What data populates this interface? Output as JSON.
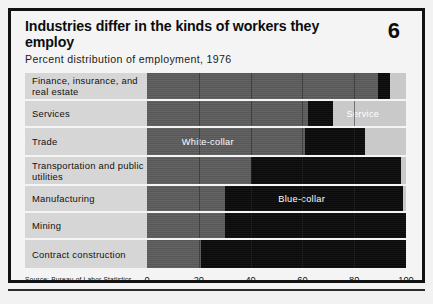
{
  "figure": {
    "title": "Industries differ in the kinds of workers they employ",
    "number": "6",
    "subtitle": "Percent distribution of employment, 1976",
    "source": "Source: Bureau of Labor Statistics"
  },
  "labels": {
    "white_collar": "White-collar",
    "blue_collar": "Blue-collar",
    "service": "Service"
  },
  "colors": {
    "white_collar": "#5c5c5c",
    "blue_collar": "#0b0b0b",
    "service": "#c9c9c9",
    "label_panel": "#d6d6d6",
    "frame": "#111111"
  },
  "chart_data": {
    "type": "bar",
    "orientation": "horizontal",
    "stacked": true,
    "title": "Industries differ in the kinds of workers they employ",
    "subtitle": "Percent distribution of employment, 1976",
    "xlabel": "",
    "ylabel": "",
    "xlim": [
      0,
      100
    ],
    "xticks": [
      0,
      20,
      40,
      60,
      80,
      100
    ],
    "xticklabels": [
      "0",
      "20",
      "40",
      "60",
      "80",
      "100"
    ],
    "grid": true,
    "legend": [
      "White-collar",
      "Blue-collar",
      "Service"
    ],
    "legend_position": "in-bars",
    "categories": [
      "Finance, insurance, and real estate",
      "Services",
      "Trade",
      "Transportation and public utilities",
      "Manufacturing",
      "Mining",
      "Contract construction"
    ],
    "series": [
      {
        "name": "White-collar",
        "values": [
          89,
          62,
          61,
          40,
          30,
          30,
          21
        ]
      },
      {
        "name": "Blue-collar",
        "values": [
          5,
          10,
          23,
          58,
          69,
          70,
          79
        ]
      },
      {
        "name": "Service",
        "values": [
          6,
          28,
          16,
          2,
          1,
          0,
          0
        ]
      }
    ]
  },
  "rows": [
    {
      "label": "Finance, insurance, and real estate",
      "white_collar": 89,
      "blue_collar": 5,
      "service": 6,
      "inbar_label": "",
      "inbar_on": ""
    },
    {
      "label": "Services",
      "white_collar": 62,
      "blue_collar": 10,
      "service": 28,
      "inbar_label": "Service",
      "inbar_on": "service"
    },
    {
      "label": "Trade",
      "white_collar": 61,
      "blue_collar": 23,
      "service": 16,
      "inbar_label": "White-collar",
      "inbar_on": "white_collar"
    },
    {
      "label": "Transportation and public utilities",
      "white_collar": 40,
      "blue_collar": 58,
      "service": 2,
      "inbar_label": "",
      "inbar_on": ""
    },
    {
      "label": "Manufacturing",
      "white_collar": 30,
      "blue_collar": 69,
      "service": 1,
      "inbar_label": "Blue-collar",
      "inbar_on": "blue_collar"
    },
    {
      "label": "Mining",
      "white_collar": 30,
      "blue_collar": 70,
      "service": 0,
      "inbar_label": "",
      "inbar_on": ""
    },
    {
      "label": "Contract construction",
      "white_collar": 21,
      "blue_collar": 79,
      "service": 0,
      "inbar_label": "",
      "inbar_on": ""
    }
  ],
  "row_heights": [
    26,
    25,
    27,
    27,
    25,
    25,
    28
  ],
  "axis": {
    "ticks": [
      "0",
      "20",
      "40",
      "60",
      "80",
      "100"
    ]
  }
}
